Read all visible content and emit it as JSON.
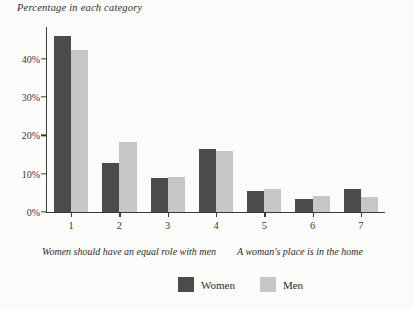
{
  "chart_data": {
    "type": "bar",
    "title": "Percentage in each category",
    "xlabel": "",
    "ylabel": "",
    "categories": [
      "1",
      "2",
      "3",
      "4",
      "5",
      "6",
      "7"
    ],
    "series": [
      {
        "name": "Women",
        "color": "#4b4b4b",
        "values": [
          46,
          12.8,
          9,
          16.5,
          5.5,
          3.4,
          6
        ]
      },
      {
        "name": "Men",
        "color": "#c6c6c6",
        "values": [
          42.3,
          18.3,
          9.2,
          16,
          6,
          4.2,
          4
        ]
      }
    ],
    "ylim": [
      0,
      48
    ],
    "yticks": [
      0,
      10,
      20,
      30,
      40
    ],
    "ytick_labels": [
      "0%",
      "10%",
      "20%",
      "30%",
      "40%"
    ],
    "grid": false,
    "legend_position": "bottom",
    "axis_captions": {
      "left": "Women should have an equal role with men",
      "right": "A woman's place is in the home"
    }
  }
}
